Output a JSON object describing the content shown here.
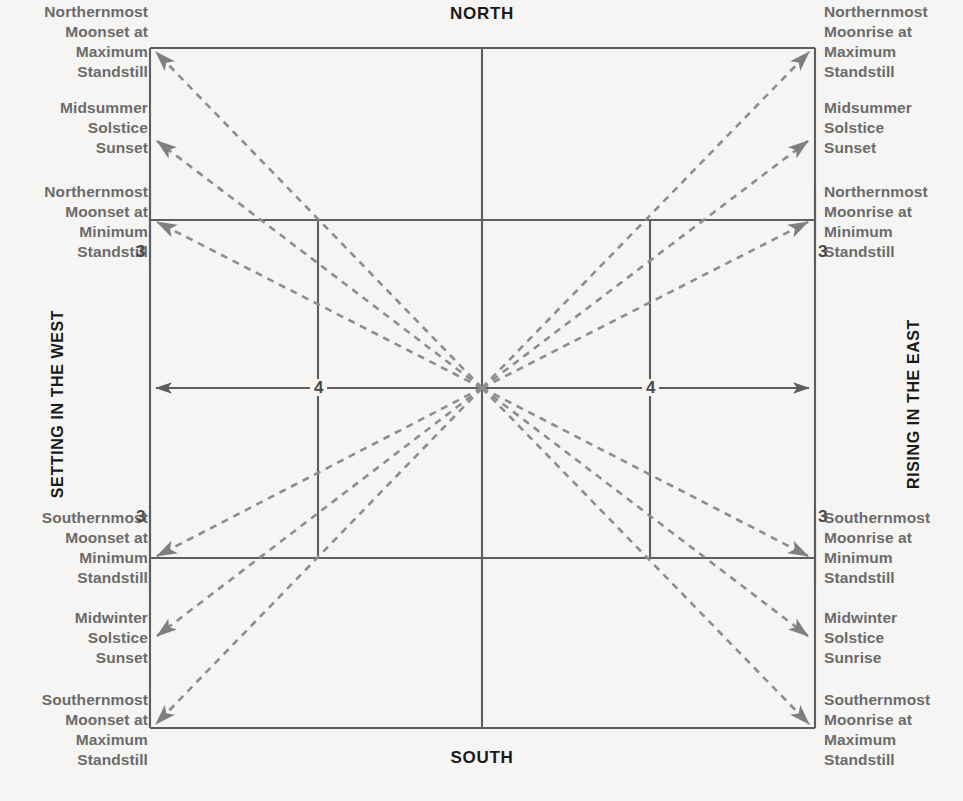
{
  "chart_data": {
    "type": "diagram",
    "cardinals": {
      "north": "NORTH",
      "south": "SOUTH",
      "west_axis": "SETTING IN THE WEST",
      "east_axis": "RISING IN THE EAST"
    },
    "tick_labels": [
      "3",
      "3",
      "4",
      "4",
      "3",
      "3"
    ],
    "events_west": [
      "Northernmost Moonset at Maximum Standstill",
      "Midsummer Solstice Sunset",
      "Northernmost Moonset at Minimum Standstill",
      "Southernmost Moonset at Minimum Standstill",
      "Midwinter Solstice Sunset",
      "Southernmost Moonset at Maximum Standstill"
    ],
    "events_east": [
      "Northernmost Moonrise at Maximum Standstill",
      "Midsummer Solstice Sunset",
      "Northernmost Moonrise at Minimum Standstill",
      "Southernmost Moonrise at Minimum Standstill",
      "Midwinter Solstice Sunrise",
      "Southernmost Moonrise at Maximum Standstill"
    ],
    "center": [
      482,
      388
    ],
    "rays": [
      {
        "name": "northernmost-moonset-max-standstill",
        "to": [
          150,
          48
        ]
      },
      {
        "name": "midsummer-solstice-sunset-west",
        "to": [
          150,
          138
        ]
      },
      {
        "name": "northernmost-moonset-min-standstill",
        "to": [
          150,
          220
        ]
      },
      {
        "name": "southernmost-moonset-min-standstill",
        "to": [
          150,
          558
        ]
      },
      {
        "name": "midwinter-solstice-sunset-west",
        "to": [
          150,
          638
        ]
      },
      {
        "name": "southernmost-moonset-max-standstill",
        "to": [
          150,
          728
        ]
      },
      {
        "name": "northernmost-moonrise-max-standstill",
        "to": [
          815,
          48
        ]
      },
      {
        "name": "midsummer-solstice-sunset-east",
        "to": [
          815,
          138
        ]
      },
      {
        "name": "northernmost-moonrise-min-standstill",
        "to": [
          815,
          220
        ]
      },
      {
        "name": "southernmost-moonrise-min-standstill",
        "to": [
          815,
          558
        ]
      },
      {
        "name": "midwinter-solstice-sunrise-east",
        "to": [
          815,
          638
        ]
      },
      {
        "name": "southernmost-moonrise-max-standstill",
        "to": [
          815,
          728
        ]
      }
    ],
    "colors": {
      "background": "#f6f5f3",
      "line": "#5e5e5e",
      "dashed": "#8d8d8d",
      "label_text": "#6b6b6b",
      "cardinal_text": "#1a1a1a"
    }
  },
  "labels": {
    "north": "NORTH",
    "south": "SOUTH",
    "west": "SETTING IN THE WEST",
    "east": "RISING IN THE EAST",
    "nw_max": "Northernmost\nMoonset at\nMaximum\nStandstill",
    "nw_sol": "Midsummer\nSolstice\nSunset",
    "nw_min": "Northernmost\nMoonset at\nMinimum\nStandstill",
    "sw_min": "Southernmost\nMoonset at\nMinimum\nStandstill",
    "sw_sol": "Midwinter\nSolstice\nSunset",
    "sw_max": "Southernmost\nMoonset at\nMaximum\nStandstill",
    "ne_max": "Northernmost\nMoonrise at\nMaximum\nStandstill",
    "ne_sol": "Midsummer\nSolstice\nSunset",
    "ne_min": "Northernmost\nMoonrise at\nMinimum\nStandstill",
    "se_min": "Southernmost\nMoonrise at\nMinimum\nStandstill",
    "se_sol": "Midwinter\nSolstice\nSunrise",
    "se_max": "Southernmost\nMoonrise at\nMaximum\nStandstill",
    "tick_nw": "3",
    "tick_ne": "3",
    "tick_w": "4",
    "tick_e": "4",
    "tick_sw": "3",
    "tick_se": "3"
  }
}
